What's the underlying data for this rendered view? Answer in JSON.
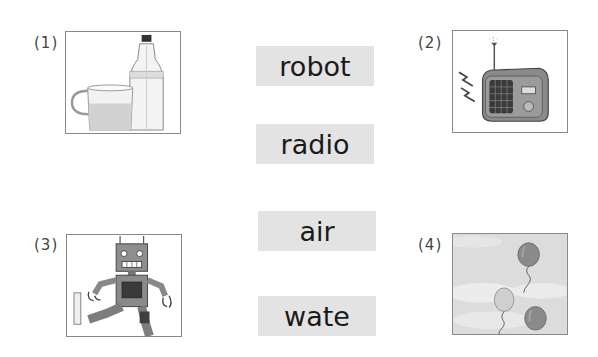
{
  "items": [
    {
      "number": "(1)",
      "image": "cup-and-water-bottle",
      "alt": "glass cup of water next to a plastic water bottle"
    },
    {
      "number": "(2)",
      "image": "radio",
      "alt": "old-fashioned radio with antenna emitting sound"
    },
    {
      "number": "(3)",
      "image": "robot",
      "alt": "cartoon robot kicking one leg"
    },
    {
      "number": "(4)",
      "image": "balloons",
      "alt": "three balloons floating in a cloudy sky"
    }
  ],
  "words": [
    "robot",
    "radio",
    "air",
    "wate"
  ],
  "colors": {
    "card_bg": "#e3e3e3",
    "frame_border": "#888888",
    "text": "#1a1a1a",
    "sky": "#dcdcdc"
  }
}
